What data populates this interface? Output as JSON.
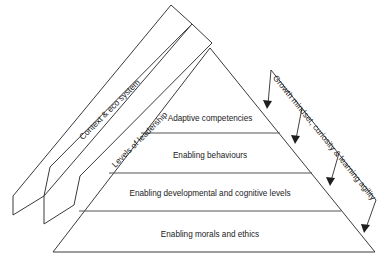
{
  "diagram": {
    "type": "layered-pyramid",
    "tiers": [
      {
        "id": "tier-1",
        "label": "Adaptive competencies",
        "level": 1
      },
      {
        "id": "tier-2",
        "label": "Enabling behaviours",
        "level": 2
      },
      {
        "id": "tier-3",
        "label": "Enabling developmental and cognitive levels",
        "level": 3
      },
      {
        "id": "tier-4",
        "label": "Enabling morals and ethics",
        "level": 4
      }
    ],
    "left_bands": [
      {
        "id": "band-outer",
        "label": "Context & eco system"
      },
      {
        "id": "band-inner",
        "label": "Levels of leadership"
      }
    ],
    "right_bracket": {
      "id": "bracket-growth",
      "label": "Growth mindset, curiosity & learning agility",
      "arrow_count": 4
    },
    "colors": {
      "stroke": "#3a3a3a",
      "divider": "#555555",
      "arrow": "#1f1f1f",
      "text": "#1b1b1b",
      "background": "#ffffff"
    }
  }
}
